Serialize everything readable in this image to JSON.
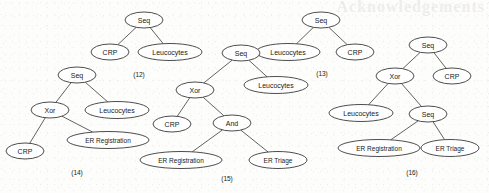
{
  "figure": {
    "background_color": "#fdfdfc",
    "node_fill": "#ffffff",
    "node_stroke": "#2e2e2e",
    "edge_color": "#3a3a3a",
    "text_color": "#1a1a1a",
    "bleed_text": "Acknowledgements"
  },
  "trees": [
    {
      "id": "tree-12",
      "caption": "(12)",
      "caption_x": 139,
      "caption_y": 74,
      "nodes": [
        {
          "name": "seq",
          "label": "Seq",
          "cx": 144,
          "cy": 20,
          "rx": 19,
          "ry": 8,
          "fs": 7
        },
        {
          "name": "crp",
          "label": "CRP",
          "cx": 110,
          "cy": 52,
          "rx": 19,
          "ry": 8,
          "fs": 7
        },
        {
          "name": "leucocytes",
          "label": "Leucocytes",
          "cx": 170,
          "cy": 52,
          "rx": 32,
          "ry": 8.5,
          "fs": 7
        }
      ],
      "edges": [
        {
          "from": "seq",
          "to": "crp"
        },
        {
          "from": "seq",
          "to": "leucocytes"
        }
      ]
    },
    {
      "id": "tree-13",
      "caption": "(13)",
      "caption_x": 322,
      "caption_y": 73,
      "nodes": [
        {
          "name": "seq",
          "label": "Seq",
          "cx": 321,
          "cy": 20,
          "rx": 19,
          "ry": 8,
          "fs": 7
        },
        {
          "name": "leucocytes",
          "label": "Leucocytes",
          "cx": 288,
          "cy": 52,
          "rx": 32,
          "ry": 8.5,
          "fs": 7
        },
        {
          "name": "crp",
          "label": "CRP",
          "cx": 355,
          "cy": 52,
          "rx": 19,
          "ry": 8,
          "fs": 7
        }
      ],
      "edges": [
        {
          "from": "seq",
          "to": "leucocytes"
        },
        {
          "from": "seq",
          "to": "crp"
        }
      ]
    },
    {
      "id": "tree-14",
      "caption": "(14)",
      "caption_x": 77,
      "caption_y": 172,
      "nodes": [
        {
          "name": "seq",
          "label": "Seq",
          "cx": 77,
          "cy": 75,
          "rx": 19,
          "ry": 8,
          "fs": 7
        },
        {
          "name": "xor",
          "label": "Xor",
          "cx": 50,
          "cy": 110,
          "rx": 19,
          "ry": 8,
          "fs": 7
        },
        {
          "name": "leucocytes",
          "label": "Leucocytes",
          "cx": 117,
          "cy": 110,
          "rx": 32,
          "ry": 8.5,
          "fs": 7
        },
        {
          "name": "crp",
          "label": "CRP",
          "cx": 25,
          "cy": 151,
          "rx": 19,
          "ry": 8,
          "fs": 7
        },
        {
          "name": "er-registration",
          "label": "ER Registration",
          "cx": 108,
          "cy": 140,
          "rx": 41,
          "ry": 8.5,
          "fs": 6.5
        }
      ],
      "edges": [
        {
          "from": "seq",
          "to": "xor"
        },
        {
          "from": "seq",
          "to": "leucocytes"
        },
        {
          "from": "xor",
          "to": "crp"
        },
        {
          "from": "xor",
          "to": "er-registration"
        }
      ]
    },
    {
      "id": "tree-15",
      "caption": "(15)",
      "caption_x": 227,
      "caption_y": 178,
      "nodes": [
        {
          "name": "seq",
          "label": "Seq",
          "cx": 241,
          "cy": 53,
          "rx": 19,
          "ry": 8,
          "fs": 7
        },
        {
          "name": "leucocytes",
          "label": "Leucocytes",
          "cx": 276,
          "cy": 85,
          "rx": 32,
          "ry": 8.5,
          "fs": 7
        },
        {
          "name": "xor",
          "label": "Xor",
          "cx": 195,
          "cy": 90,
          "rx": 19,
          "ry": 8,
          "fs": 7
        },
        {
          "name": "crp",
          "label": "CRP",
          "cx": 172,
          "cy": 124,
          "rx": 19,
          "ry": 8,
          "fs": 7
        },
        {
          "name": "and",
          "label": "And",
          "cx": 232,
          "cy": 123,
          "rx": 19,
          "ry": 8,
          "fs": 7
        },
        {
          "name": "er-registration",
          "label": "ER Registration",
          "cx": 181,
          "cy": 160,
          "rx": 41,
          "ry": 8.5,
          "fs": 6.5
        },
        {
          "name": "er-triage",
          "label": "ER Triage",
          "cx": 278,
          "cy": 160,
          "rx": 29,
          "ry": 8.5,
          "fs": 6.5
        }
      ],
      "edges": [
        {
          "from": "seq",
          "to": "leucocytes"
        },
        {
          "from": "seq",
          "to": "xor"
        },
        {
          "from": "xor",
          "to": "crp"
        },
        {
          "from": "xor",
          "to": "and"
        },
        {
          "from": "and",
          "to": "er-registration"
        },
        {
          "from": "and",
          "to": "er-triage"
        }
      ]
    },
    {
      "id": "tree-16",
      "caption": "(16)",
      "caption_x": 412,
      "caption_y": 172,
      "nodes": [
        {
          "name": "seq",
          "label": "Seq",
          "cx": 428,
          "cy": 45,
          "rx": 19,
          "ry": 8,
          "fs": 7
        },
        {
          "name": "xor",
          "label": "Xor",
          "cx": 395,
          "cy": 76,
          "rx": 19,
          "ry": 8,
          "fs": 7
        },
        {
          "name": "crp",
          "label": "CRP",
          "cx": 452,
          "cy": 76,
          "rx": 19,
          "ry": 8,
          "fs": 7
        },
        {
          "name": "leucocytes",
          "label": "Leucocytes",
          "cx": 361,
          "cy": 113,
          "rx": 32,
          "ry": 8.5,
          "fs": 7
        },
        {
          "name": "seq-2",
          "label": "Seq",
          "cx": 428,
          "cy": 114,
          "rx": 19,
          "ry": 8,
          "fs": 7
        },
        {
          "name": "er-registration",
          "label": "ER Registration",
          "cx": 379,
          "cy": 148,
          "rx": 41,
          "ry": 8.5,
          "fs": 6.5
        },
        {
          "name": "er-triage",
          "label": "ER Triage",
          "cx": 450,
          "cy": 148,
          "rx": 29,
          "ry": 8.5,
          "fs": 6.5
        }
      ],
      "edges": [
        {
          "from": "seq",
          "to": "xor"
        },
        {
          "from": "seq",
          "to": "crp"
        },
        {
          "from": "xor",
          "to": "leucocytes"
        },
        {
          "from": "xor",
          "to": "seq-2"
        },
        {
          "from": "seq-2",
          "to": "er-registration"
        },
        {
          "from": "seq-2",
          "to": "er-triage"
        }
      ]
    }
  ]
}
